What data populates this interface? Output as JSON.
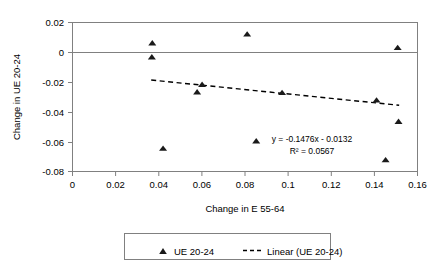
{
  "chart_data": {
    "type": "scatter",
    "title": "",
    "xlabel": "Change in E 55-64",
    "ylabel": "Change in UE 20-24",
    "xlim": [
      0,
      0.16
    ],
    "ylim": [
      -0.08,
      0.02
    ],
    "xticks": [
      "0",
      "0.02",
      "0.04",
      "0.06",
      "0.08",
      "0.1",
      "0.12",
      "0.14",
      "0.16"
    ],
    "xtick_values": [
      0,
      0.02,
      0.04,
      0.06,
      0.08,
      0.1,
      0.12,
      0.14,
      0.16
    ],
    "yticks": [
      "0.02",
      "0",
      "-0.02",
      "-0.04",
      "-0.06",
      "-0.08"
    ],
    "ytick_values": [
      0.02,
      0,
      -0.02,
      -0.04,
      -0.06,
      -0.08
    ],
    "grid": false,
    "legend_position": "bottom",
    "series": [
      {
        "name": "UE 20-24",
        "type": "scatter",
        "marker": "triangle",
        "color": "#1a1a1a",
        "points": [
          {
            "x": 0.037,
            "y": 0.0062
          },
          {
            "x": 0.0368,
            "y": -0.0032
          },
          {
            "x": 0.042,
            "y": -0.0645
          },
          {
            "x": 0.0578,
            "y": -0.0267
          },
          {
            "x": 0.0601,
            "y": -0.0216
          },
          {
            "x": 0.081,
            "y": 0.0122
          },
          {
            "x": 0.0852,
            "y": -0.0595
          },
          {
            "x": 0.0972,
            "y": -0.0271
          },
          {
            "x": 0.141,
            "y": -0.0321
          },
          {
            "x": 0.1452,
            "y": -0.0722
          },
          {
            "x": 0.1508,
            "y": 0.0031
          },
          {
            "x": 0.1512,
            "y": -0.0465
          }
        ]
      },
      {
        "name": "Linear (UE 20-24)",
        "type": "line",
        "style": "dashed",
        "color": "#000000",
        "equation": "y = -0.1476x - 0.0132",
        "r2_label": "R² = 0.0567",
        "slope": -0.1476,
        "intercept": -0.0132,
        "r_squared": 0.0567,
        "x_start": 0.0365,
        "x_end": 0.1515
      }
    ],
    "annotations": [
      {
        "name": "equation",
        "text": "y = -0.1476x - 0.0132"
      },
      {
        "name": "r-squared",
        "text": "R² = 0.0567"
      }
    ],
    "legend": [
      {
        "label": "UE 20-24",
        "marker": "triangle"
      },
      {
        "label": "Linear (UE 20-24)",
        "marker": "dashed-line"
      }
    ]
  }
}
